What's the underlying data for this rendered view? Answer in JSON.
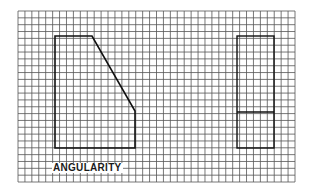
{
  "diagram": {
    "title": "ANGULARITY",
    "grid": {
      "x0": 18,
      "y0": 11,
      "x1": 295,
      "y1": 182,
      "cell": 6.93,
      "line_color": "#555555"
    },
    "shapes": {
      "left": {
        "kind": "polygon",
        "points": "55,36 92,36 135,111 135,148 55,148",
        "stroke": "#111111"
      },
      "right": {
        "kind": "rectangle",
        "x": 237,
        "y": 36,
        "width": 37,
        "height": 112,
        "divider_y": 112,
        "stroke": "#111111"
      }
    },
    "label_position": {
      "left": 52,
      "top": 163
    }
  }
}
